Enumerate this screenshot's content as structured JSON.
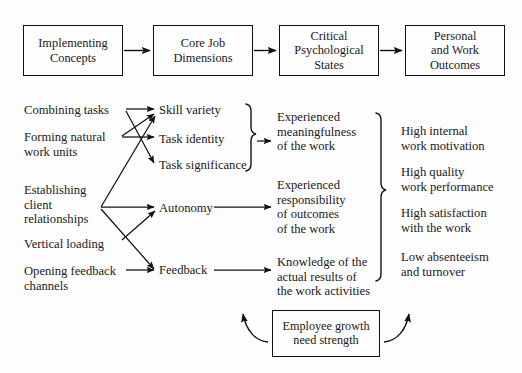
{
  "diagram": {
    "top_row": [
      {
        "id": "implementing-concepts",
        "text": "Implementing\nConcepts",
        "x": 23,
        "y": 25,
        "w": 100,
        "h": 51
      },
      {
        "id": "core-job-dimensions",
        "text": "Core Job\nDimensions",
        "x": 153,
        "y": 25,
        "w": 100,
        "h": 51
      },
      {
        "id": "critical-psychological-states",
        "text": "Critical\nPsychological\nStates",
        "x": 279,
        "y": 25,
        "w": 100,
        "h": 51
      },
      {
        "id": "personal-and-work-outcomes",
        "text": "Personal\nand Work\nOutcomes",
        "x": 405,
        "y": 25,
        "w": 100,
        "h": 51
      }
    ],
    "implementing_concepts": [
      {
        "id": "combining-tasks",
        "text": "Combining tasks",
        "x": 24,
        "y": 103
      },
      {
        "id": "forming-natural-work-units",
        "text": "Forming natural\nwork units",
        "x": 24,
        "y": 130
      },
      {
        "id": "establishing-client-relationships",
        "text": "Establishing\nclient\nrelationships",
        "x": 24,
        "y": 183
      },
      {
        "id": "vertical-loading",
        "text": "Vertical loading",
        "x": 24,
        "y": 237
      },
      {
        "id": "opening-feedback-channels",
        "text": "Opening feedback\nchannels",
        "x": 24,
        "y": 264
      }
    ],
    "core_job_dimensions": [
      {
        "id": "skill-variety",
        "text": "Skill variety",
        "x": 159,
        "y": 103
      },
      {
        "id": "task-identity",
        "text": "Task identity",
        "x": 159,
        "y": 132
      },
      {
        "id": "task-significance",
        "text": "Task significance",
        "x": 159,
        "y": 158
      },
      {
        "id": "autonomy",
        "text": "Autonomy",
        "x": 159,
        "y": 201
      },
      {
        "id": "feedback",
        "text": "Feedback",
        "x": 159,
        "y": 263
      }
    ],
    "psychological_states": [
      {
        "id": "experienced-meaningfulness",
        "text": "Experienced\nmeaningfulness\nof the work",
        "x": 277,
        "y": 110
      },
      {
        "id": "experienced-responsibility",
        "text": "Experienced\nresponsibility\nof outcomes\nof the work",
        "x": 277,
        "y": 178
      },
      {
        "id": "knowledge-of-results",
        "text": "Knowledge of the\nactual results of\nthe work activities",
        "x": 277,
        "y": 255
      }
    ],
    "work_outcomes": [
      {
        "id": "high-internal-work-motivation",
        "text": "High internal\nwork motivation",
        "x": 401,
        "y": 124
      },
      {
        "id": "high-quality-work-performance",
        "text": "High quality\nwork performance",
        "x": 401,
        "y": 165
      },
      {
        "id": "high-satisfaction-with-the-work",
        "text": "High satisfaction\nwith the work",
        "x": 401,
        "y": 206
      },
      {
        "id": "low-absenteeism-and-turnover",
        "text": "Low absenteeism\nand turnover",
        "x": 401,
        "y": 250
      }
    ],
    "moderator": {
      "id": "employee-growth-need-strength",
      "text": "Employee growth\nneed strength",
      "x": 272,
      "y": 310,
      "w": 108,
      "h": 47
    },
    "colors": {
      "stroke": "#111111",
      "text": "#1a1a1a",
      "background": "#fdfdfd"
    }
  }
}
